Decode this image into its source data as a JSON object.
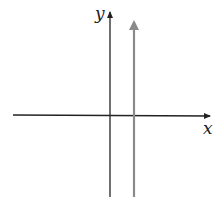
{
  "diagram": {
    "x_axis_label": "x",
    "y_axis_label": "y",
    "colors": {
      "axes": "#222222",
      "graph_line": "#8a8a8a"
    }
  }
}
